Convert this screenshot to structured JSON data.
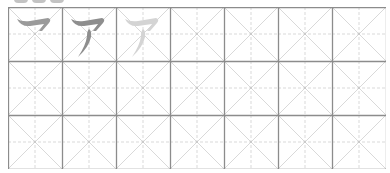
{
  "worksheet": {
    "type": "katakana stroke-order practice grid",
    "character": "ア",
    "romaji": "a",
    "rows": 3,
    "cols": 7,
    "cell_size_px": 54,
    "colors": {
      "border": "#8c8c8c",
      "guide": "#d9d9d9",
      "stroke_step": "#9a9a9a",
      "stroke_full": "#8e8e8e",
      "stroke_trace": "#d4d4d4"
    },
    "demo_cells": [
      {
        "index": 0,
        "label": "stroke-1",
        "char": "フ",
        "shade": "stroke_step"
      },
      {
        "index": 1,
        "label": "complete",
        "char": "ア",
        "shade": "stroke_full"
      },
      {
        "index": 2,
        "label": "trace",
        "char": "ア",
        "shade": "stroke_trace"
      }
    ],
    "top_indicators": 3
  }
}
